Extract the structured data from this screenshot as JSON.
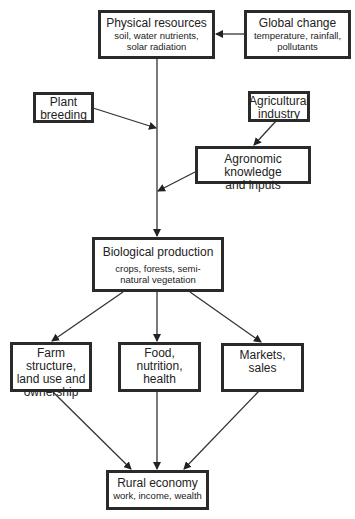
{
  "diagram": {
    "nodes": {
      "physical": {
        "title": "Physical resources",
        "sub1": "soil, water nutrients,",
        "sub2": "solar radiation"
      },
      "global": {
        "title": "Global change",
        "sub1": "temperature, rainfall,",
        "sub2": "pollutants"
      },
      "plant": {
        "line1": "Plant",
        "line2": "breeding"
      },
      "agri_industry": {
        "line1": "Agricultural",
        "line2": "industry"
      },
      "agronomic": {
        "line1": "Agronomic knowledge",
        "line2": "and inputs"
      },
      "biological": {
        "title": "Biological production",
        "sub1": "crops, forests, semi-",
        "sub2": "natural vegetation"
      },
      "farm": {
        "line1": "Farm structure,",
        "line2": "land use and",
        "line3": "ownership"
      },
      "food": {
        "line1": "Food, nutrition,",
        "line2": "health"
      },
      "markets": {
        "line1": "Markets, sales"
      },
      "rural": {
        "title": "Rural economy",
        "sub1": "work, income, wealth"
      }
    },
    "edges": [
      {
        "from": "global",
        "to": "physical"
      },
      {
        "from": "physical",
        "to": "biological"
      },
      {
        "from": "plant",
        "to": "biological"
      },
      {
        "from": "agri_industry",
        "to": "agronomic"
      },
      {
        "from": "agronomic",
        "to": "biological"
      },
      {
        "from": "biological",
        "to": "farm"
      },
      {
        "from": "biological",
        "to": "food"
      },
      {
        "from": "biological",
        "to": "markets"
      },
      {
        "from": "farm",
        "to": "rural"
      },
      {
        "from": "food",
        "to": "rural"
      },
      {
        "from": "markets",
        "to": "rural"
      }
    ]
  }
}
